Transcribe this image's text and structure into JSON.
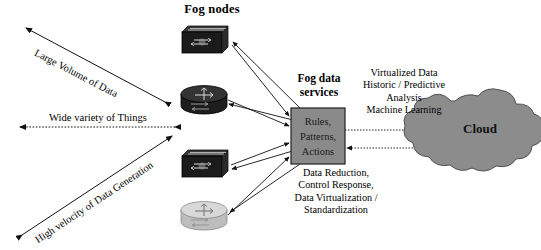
{
  "diagram": {
    "title_fog_nodes": "Fog nodes",
    "fog_data_services_title": "Fog data services",
    "box": {
      "line1": "Rules,",
      "line2": "Patterns,",
      "line3": "Actions",
      "fill_color": "#8a8a8a",
      "border_color": "#222222"
    },
    "cloud": {
      "label": "Cloud",
      "fill_color": "#8c8c8c",
      "border_color": "#4a4a4a"
    },
    "right_annotation": {
      "line1": "Virtualized Data",
      "line2": "Historic / Predictive",
      "line3": "Analysis",
      "line4": "Machine Learning"
    },
    "bottom_annotation": {
      "line1": "Data Reduction,",
      "line2": "Control Response,",
      "line3": "Data Virtualization /",
      "line4": "Standardization"
    },
    "axis_labels": {
      "volume": "Large Volume of Data",
      "variety": "Wide variety of Things",
      "velocity": "High velocity of Data Generation"
    },
    "nodes": [
      {
        "name": "fog-node-switch-1",
        "type": "switch",
        "shade": "dark"
      },
      {
        "name": "fog-node-router-1",
        "type": "router",
        "shade": "dark"
      },
      {
        "name": "fog-node-switch-2",
        "type": "switch",
        "shade": "dark"
      },
      {
        "name": "fog-node-router-2",
        "type": "router",
        "shade": "light"
      }
    ]
  }
}
